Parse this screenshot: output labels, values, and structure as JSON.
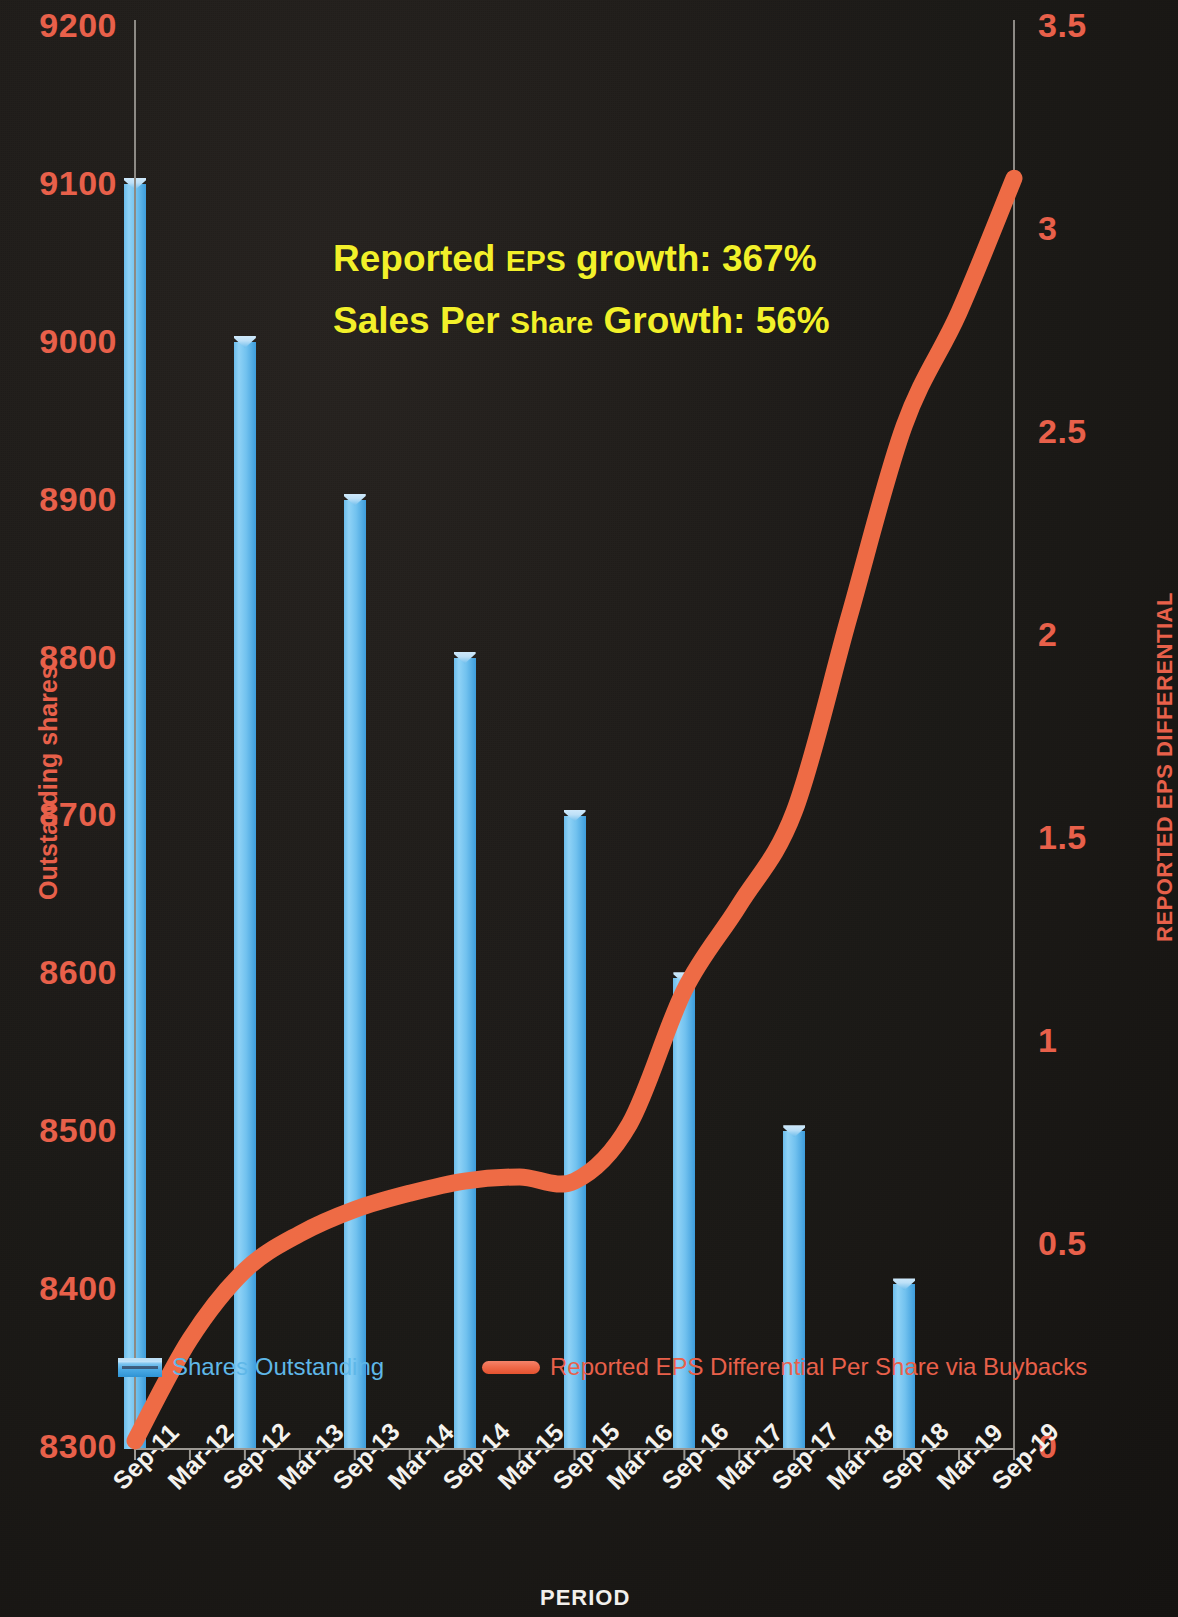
{
  "chart_data": {
    "type": "bar",
    "title": "",
    "xlabel": "PERIOD",
    "categories": [
      "Sep-11",
      "Mar-12",
      "Sep-12",
      "Mar-13",
      "Sep-13",
      "Mar-14",
      "Sep-14",
      "Mar-15",
      "Sep-15",
      "Mar-16",
      "Sep-16",
      "Mar-17",
      "Sep-17",
      "Mar-18",
      "Sep-18",
      "Mar-19",
      "Sep-19"
    ],
    "grid": false,
    "legend_position": "inside-bottom",
    "axes": {
      "left": {
        "label": "Outstanding shares",
        "min": 8300,
        "max": 9200,
        "step": 100,
        "ticks": [
          "8300",
          "8400",
          "8500",
          "8600",
          "8700",
          "8800",
          "8900",
          "9000",
          "9100",
          "9200"
        ],
        "color": "#e8604a"
      },
      "right": {
        "label": "REPORTED EPS DIFFERENTIAL",
        "min": 0,
        "max": 3.5,
        "step": 0.5,
        "ticks": [
          "0",
          "0.5",
          "1",
          "1.5",
          "2",
          "2.5",
          "3",
          "3.5"
        ],
        "color": "#e8604a"
      }
    },
    "series": [
      {
        "name": "Shares Outstanding",
        "type": "bar",
        "axis": "left",
        "color": "#5fb7e8",
        "values": [
          9105,
          null,
          9005,
          null,
          8905,
          null,
          8805,
          null,
          8705,
          null,
          8602,
          null,
          8505,
          null,
          8408,
          null,
          null
        ]
      },
      {
        "name": "Reported EPS Differential Per Share via Buybacks",
        "type": "line",
        "axis": "right",
        "color": "#ee6b45",
        "values": [
          0.02,
          0.27,
          0.44,
          0.53,
          0.59,
          0.63,
          0.66,
          0.67,
          0.66,
          0.8,
          1.13,
          1.34,
          1.57,
          2.05,
          2.52,
          2.8,
          3.13
        ]
      }
    ],
    "annotations": [
      {
        "id": "eps-growth",
        "text_main": "Reported ",
        "text_small": "EPS",
        "text_tail": " growth: 367%",
        "color": "#f2f02a"
      },
      {
        "id": "sps-growth",
        "text_main": "Sales Per ",
        "text_small": "Share",
        "text_tail": " Growth: 56%",
        "color": "#f2f02a"
      }
    ]
  },
  "legend": {
    "bar_label": "Shares Outstanding",
    "line_label": "Reported EPS Differential Per Share via Buybacks"
  },
  "annotations": {
    "line1_a": "Reported ",
    "line1_b": "EPS",
    "line1_c": " growth: 367%",
    "line2_a": "Sales Per ",
    "line2_b": "Share",
    "line2_c": " Growth: 56%"
  },
  "colors": {
    "background": "#1c1a17",
    "bar": "#5fb7e8",
    "line": "#ee6b45",
    "axis_text": "#e8604a",
    "tick_text": "#f4f2ee",
    "annotation": "#f2f02a"
  }
}
